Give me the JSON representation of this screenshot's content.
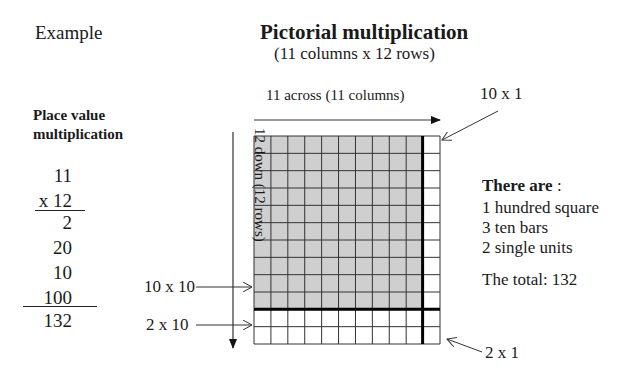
{
  "header": {
    "example_label": "Example",
    "title": "Pictorial multiplication",
    "subtitle": "(11 columns x 12 rows)"
  },
  "place_value": {
    "title_line1": "Place value",
    "title_line2": "multiplication",
    "multiplicand": "11",
    "multiplier": "x 12",
    "partial_products": [
      "2",
      "20",
      "10",
      "100"
    ],
    "total": "132"
  },
  "grid": {
    "columns": 11,
    "rows": 12,
    "shaded_columns": 10,
    "shaded_rows": 10,
    "shade_color": "#cfcfcf",
    "line_color": "#333333",
    "across_label": "11 across (11 columns)",
    "down_label": "12 down (12 rows)"
  },
  "callouts": {
    "ten_by_one": "10 x 1",
    "ten_by_ten": "10 x 10",
    "two_by_ten": "2 x 10",
    "two_by_one": "2 x 1"
  },
  "summary": {
    "heading_bold": "There are",
    "heading_suffix": " :",
    "items": [
      "1 hundred square",
      "3 ten bars",
      "2 single units"
    ],
    "total": "The total: 132"
  }
}
